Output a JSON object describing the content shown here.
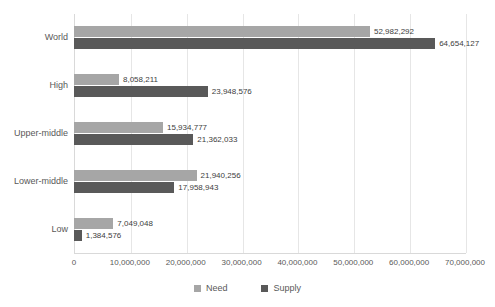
{
  "chart_data": {
    "type": "bar",
    "orientation": "horizontal",
    "title": "",
    "xlabel": "",
    "ylabel": "",
    "categories": [
      "World",
      "High",
      "Upper-middle",
      "Lower-middle",
      "Low"
    ],
    "series": [
      {
        "name": "Need",
        "color": "#a6a6a6",
        "values": [
          52982292,
          15934777,
          21940256,
          7049048,
          8058211
        ],
        "values_by_category": {
          "World": 52982292,
          "High": 8058211,
          "Upper-middle": 15934777,
          "Lower-middle": 21940256,
          "Low": 7049048
        },
        "labels_by_category": {
          "World": "52,982,292",
          "High": "8,058,211",
          "Upper-middle": "15,934,777",
          "Lower-middle": "21,940,256",
          "Low": "7,049,048"
        }
      },
      {
        "name": "Supply",
        "color": "#595959",
        "values": [
          64654127,
          23948576,
          21362033,
          17958943,
          1384576
        ],
        "values_by_category": {
          "World": 64654127,
          "High": 23948576,
          "Upper-middle": 21362033,
          "Lower-middle": 17958943,
          "Low": 1384576
        },
        "labels_by_category": {
          "World": "64,654,127",
          "High": "23,948,576",
          "Upper-middle": "21,362,033",
          "Lower-middle": "17,958,943",
          "Low": "1,384,576"
        }
      }
    ],
    "xlim": [
      0,
      70000000
    ],
    "xticks": [
      0,
      10000000,
      20000000,
      30000000,
      40000000,
      50000000,
      60000000,
      70000000
    ],
    "xtick_labels": [
      "0",
      "10,000,000",
      "20,000,000",
      "30,000,000",
      "40,000,000",
      "50,000,000",
      "60,000,000",
      "70,000,000"
    ],
    "grid": true,
    "grid_axis": "x",
    "legend": [
      "Need",
      "Supply"
    ],
    "legend_position": "bottom",
    "data_labels": true
  },
  "legend": {
    "items": [
      {
        "label": "Need",
        "color": "#a6a6a6"
      },
      {
        "label": "Supply",
        "color": "#595959"
      }
    ]
  },
  "colors": {
    "need": "#a6a6a6",
    "supply": "#595959",
    "gridline": "#e6e6e6",
    "axis": "#d9d9d9",
    "text": "#595959",
    "label_text": "#404040",
    "background": "#ffffff"
  }
}
